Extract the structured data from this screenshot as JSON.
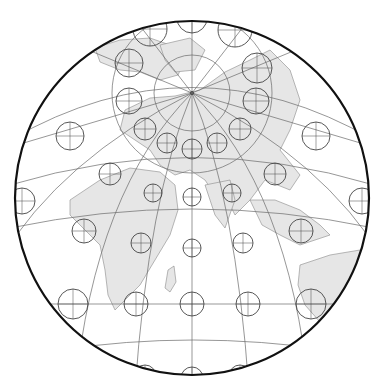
{
  "map": {
    "type": "azimuthal projection with Tissot indicatrices",
    "colors": {
      "background": "#ffffff",
      "land": "#e6e6e6",
      "coast": "#8a8a8a",
      "graticule": "#6a6a6a",
      "tissot": "#444444",
      "border": "#111111"
    },
    "frame": {
      "cx": 192,
      "cy": 198,
      "r": 177
    },
    "pole": {
      "x": 192,
      "y": 93
    },
    "tissot_circles": [
      {
        "x": 150,
        "y": 29,
        "r": 17
      },
      {
        "x": 192,
        "y": 18,
        "r": 15
      },
      {
        "x": 235,
        "y": 30,
        "r": 17
      },
      {
        "x": 129,
        "y": 63,
        "r": 14
      },
      {
        "x": 257,
        "y": 68,
        "r": 15
      },
      {
        "x": 129,
        "y": 101,
        "r": 13
      },
      {
        "x": 256,
        "y": 101,
        "r": 13
      },
      {
        "x": 70,
        "y": 136,
        "r": 14
      },
      {
        "x": 145,
        "y": 129,
        "r": 11
      },
      {
        "x": 167,
        "y": 143,
        "r": 10
      },
      {
        "x": 192,
        "y": 149,
        "r": 10
      },
      {
        "x": 217,
        "y": 143,
        "r": 10
      },
      {
        "x": 240,
        "y": 129,
        "r": 11
      },
      {
        "x": 316,
        "y": 136,
        "r": 14
      },
      {
        "x": 110,
        "y": 174,
        "r": 11
      },
      {
        "x": 153,
        "y": 193,
        "r": 9
      },
      {
        "x": 192,
        "y": 197,
        "r": 9
      },
      {
        "x": 232,
        "y": 193,
        "r": 9
      },
      {
        "x": 275,
        "y": 174,
        "r": 11
      },
      {
        "x": 22,
        "y": 201,
        "r": 13
      },
      {
        "x": 84,
        "y": 231,
        "r": 12
      },
      {
        "x": 141,
        "y": 243,
        "r": 10
      },
      {
        "x": 192,
        "y": 248,
        "r": 9
      },
      {
        "x": 243,
        "y": 243,
        "r": 10
      },
      {
        "x": 301,
        "y": 231,
        "r": 12
      },
      {
        "x": 362,
        "y": 201,
        "r": 13
      },
      {
        "x": 73,
        "y": 304,
        "r": 15
      },
      {
        "x": 136,
        "y": 304,
        "r": 12
      },
      {
        "x": 192,
        "y": 304,
        "r": 12
      },
      {
        "x": 248,
        "y": 304,
        "r": 12
      },
      {
        "x": 311,
        "y": 304,
        "r": 15
      },
      {
        "x": 145,
        "y": 376,
        "r": 11
      },
      {
        "x": 192,
        "y": 378,
        "r": 11
      },
      {
        "x": 240,
        "y": 376,
        "r": 11
      }
    ],
    "parallels_y_at_center": [
      45,
      93,
      148,
      196,
      248,
      304,
      366
    ],
    "meridian_bottom_x": [
      75,
      135,
      192,
      248,
      310
    ]
  }
}
